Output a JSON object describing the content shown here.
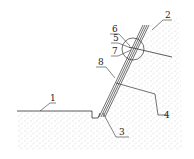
{
  "diagram": {
    "title": "",
    "labels": [
      {
        "id": "1",
        "text": "1",
        "x": 50,
        "y": 101
      },
      {
        "id": "2",
        "text": "2",
        "x": 165,
        "y": 17
      },
      {
        "id": "3",
        "text": "3",
        "x": 119,
        "y": 135
      },
      {
        "id": "4",
        "text": "4",
        "x": 164,
        "y": 118
      },
      {
        "id": "5",
        "text": "5",
        "x": 113,
        "y": 41
      },
      {
        "id": "6",
        "text": "6",
        "x": 112,
        "y": 31
      },
      {
        "id": "7",
        "text": "7",
        "x": 113,
        "y": 54
      },
      {
        "id": "8",
        "text": "8",
        "x": 99,
        "y": 65
      }
    ],
    "colors": {
      "line": "#333333",
      "fill_dots": "#9a9a9a",
      "background": "#ffffff"
    }
  }
}
